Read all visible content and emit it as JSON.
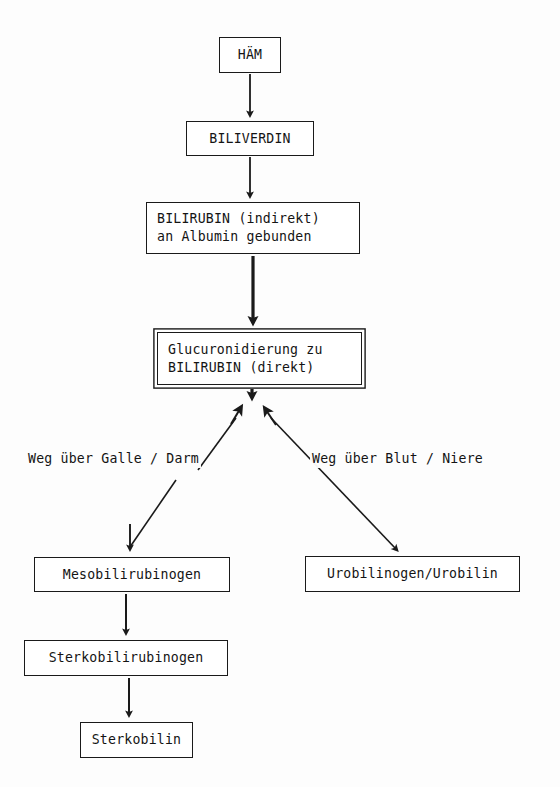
{
  "diagram": {
    "background_color": "#fdfdfd",
    "stroke_color": "#1a1a1a",
    "text_color": "#141414",
    "nodes": [
      {
        "id": "haem",
        "label": "HÄM",
        "lines": [
          "HÄM"
        ],
        "style": "single",
        "x": 219,
        "y": 37,
        "w": 62,
        "h": 36
      },
      {
        "id": "biliverdin",
        "label": "BILIVERDIN",
        "lines": [
          "BILIVERDIN"
        ],
        "style": "single",
        "x": 186,
        "y": 121,
        "w": 128,
        "h": 35
      },
      {
        "id": "bilirubin_indirekt",
        "label": "BILIRUBIN (indirekt) an Albumin gebunden",
        "lines": [
          "BILIRUBIN (indirekt)",
          "an Albumin gebunden"
        ],
        "style": "single",
        "x": 146,
        "y": 202,
        "w": 214,
        "h": 52
      },
      {
        "id": "glucuronidierung",
        "label": "Glucuronidierung zu BILIRUBIN (direkt)",
        "lines": [
          "Glucuronidierung zu",
          "BILIRUBIN (direkt)"
        ],
        "style": "double",
        "x": 157,
        "y": 332,
        "w": 205,
        "h": 53
      },
      {
        "id": "mesobilirubinogen",
        "label": "Mesobilirubinogen",
        "lines": [
          "Mesobilirubinogen"
        ],
        "style": "single",
        "x": 34,
        "y": 557,
        "w": 196,
        "h": 35
      },
      {
        "id": "urobilinogen",
        "label": "Urobilinogen/Urobilin",
        "lines": [
          "Urobilinogen/Urobilin"
        ],
        "style": "single",
        "x": 305,
        "y": 556,
        "w": 215,
        "h": 36
      },
      {
        "id": "sterkobilirubinogen",
        "label": "Sterkobilirubinogen",
        "lines": [
          "Sterkobilirubinogen"
        ],
        "style": "single",
        "x": 24,
        "y": 640,
        "w": 204,
        "h": 36
      },
      {
        "id": "sterkobilin",
        "label": "Sterkobilin",
        "lines": [
          "Sterkobilin"
        ],
        "style": "single",
        "x": 80,
        "y": 722,
        "w": 113,
        "h": 36
      }
    ],
    "edge_labels": [
      {
        "id": "weg-galle-darm",
        "text": "Weg über Galle / Darm",
        "x": 26,
        "y": 450
      },
      {
        "id": "weg-blut-niere",
        "text": "Weg über Blut / Niere",
        "x": 310,
        "y": 450
      }
    ],
    "connectors": [
      {
        "id": "haem-to-biliverdin",
        "from": "haem",
        "to": "biliverdin",
        "kind": "vertical-thin"
      },
      {
        "id": "biliverdin-to-bilirubin-indirekt",
        "from": "biliverdin",
        "to": "bilirubin_indirekt",
        "kind": "vertical-thin"
      },
      {
        "id": "bilirubin-indirekt-to-glucuronidierung",
        "from": "bilirubin_indirekt",
        "to": "glucuronidierung",
        "kind": "vertical-thick"
      },
      {
        "id": "glucuronidierung-to-branchpoint",
        "from": "glucuronidierung",
        "to": "branch-point",
        "kind": "vertical-thick"
      },
      {
        "id": "branch-arrow-left",
        "from": "branch-point",
        "to": "galle-darm-path",
        "kind": "diagonal-up-left"
      },
      {
        "id": "branch-arrow-right",
        "from": "branch-point",
        "to": "blut-niere-path",
        "kind": "diagonal-up-right"
      },
      {
        "id": "galle-darm-to-mesobilirubinogen",
        "from": "galle-darm-path",
        "to": "mesobilirubinogen",
        "kind": "diagonal-down-left"
      },
      {
        "id": "blut-niere-to-urobilinogen",
        "from": "blut-niere-path",
        "to": "urobilinogen",
        "kind": "diagonal-down-right"
      },
      {
        "id": "mesobilirubinogen-to-sterkobilirubinogen",
        "from": "mesobilirubinogen",
        "to": "sterkobilirubinogen",
        "kind": "vertical-thin"
      },
      {
        "id": "sterkobilirubinogen-to-sterkobilin",
        "from": "sterkobilirubinogen",
        "to": "sterkobilin",
        "kind": "vertical-thin"
      }
    ]
  }
}
